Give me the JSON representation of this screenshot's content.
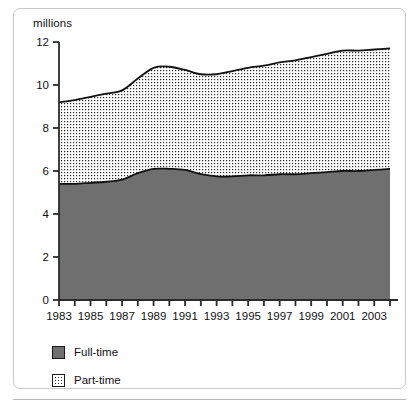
{
  "chart_data": {
    "type": "area",
    "stacked": true,
    "title": "",
    "subtitle": "",
    "xlabel": "",
    "ylabel": "millions",
    "ylim": [
      0,
      12
    ],
    "yticks": [
      0,
      2,
      4,
      6,
      8,
      10,
      12
    ],
    "ytick_labels": [
      "0",
      "2",
      "4",
      "6",
      "8",
      "10",
      "12"
    ],
    "xlim": [
      1983,
      2004
    ],
    "xticks": [
      1983,
      1984,
      1985,
      1986,
      1987,
      1988,
      1989,
      1990,
      1991,
      1992,
      1993,
      1994,
      1995,
      1996,
      1997,
      1998,
      1999,
      2000,
      2001,
      2002,
      2003,
      2004
    ],
    "xtick_labels": [
      "1983",
      "1985",
      "1987",
      "1989",
      "1991",
      "1993",
      "1995",
      "1997",
      "1999",
      "2001",
      "2003"
    ],
    "xtick_label_years": [
      1983,
      1985,
      1987,
      1989,
      1991,
      1993,
      1995,
      1997,
      1999,
      2001,
      2003
    ],
    "grid": false,
    "legend_position": "below-left",
    "x": [
      1983,
      1984,
      1985,
      1986,
      1987,
      1988,
      1989,
      1990,
      1991,
      1992,
      1993,
      1994,
      1995,
      1996,
      1997,
      1998,
      1999,
      2000,
      2001,
      2002,
      2003,
      2004
    ],
    "series": [
      {
        "name": "Full-time",
        "fill": "#6f6f6f",
        "values": [
          5.4,
          5.4,
          5.45,
          5.5,
          5.6,
          5.9,
          6.1,
          6.1,
          6.05,
          5.85,
          5.75,
          5.75,
          5.8,
          5.8,
          5.85,
          5.85,
          5.9,
          5.95,
          6.0,
          6.0,
          6.05,
          6.1
        ]
      },
      {
        "name": "Part-time",
        "fill": "#ffffff-dotted",
        "values": [
          3.8,
          3.9,
          4.0,
          4.1,
          4.15,
          4.4,
          4.7,
          4.75,
          4.65,
          4.65,
          4.75,
          4.9,
          5.0,
          5.1,
          5.2,
          5.3,
          5.4,
          5.5,
          5.6,
          5.6,
          5.6,
          5.6
        ]
      }
    ],
    "cumulative_totals": [
      9.2,
      9.3,
      9.45,
      9.6,
      9.75,
      10.3,
      10.8,
      10.85,
      10.7,
      10.5,
      10.5,
      10.65,
      10.8,
      10.9,
      11.05,
      11.15,
      11.3,
      11.45,
      11.6,
      11.6,
      11.65,
      11.7
    ]
  },
  "axis": {
    "y_title": "millions"
  },
  "legend": {
    "items": [
      {
        "label": "Full-time"
      },
      {
        "label": "Part-time"
      }
    ]
  }
}
